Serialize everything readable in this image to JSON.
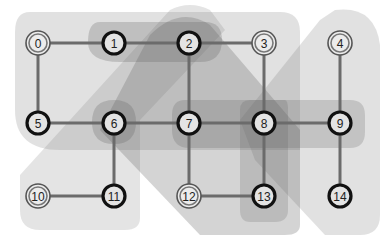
{
  "diagram": {
    "type": "graph-with-hyperedges",
    "nodes": [
      {
        "id": 0,
        "label": "0",
        "style": "double"
      },
      {
        "id": 1,
        "label": "1",
        "style": "bold"
      },
      {
        "id": 2,
        "label": "2",
        "style": "bold"
      },
      {
        "id": 3,
        "label": "3",
        "style": "double"
      },
      {
        "id": 4,
        "label": "4",
        "style": "double"
      },
      {
        "id": 5,
        "label": "5",
        "style": "bold"
      },
      {
        "id": 6,
        "label": "6",
        "style": "bold"
      },
      {
        "id": 7,
        "label": "7",
        "style": "bold"
      },
      {
        "id": 8,
        "label": "8",
        "style": "bold"
      },
      {
        "id": 9,
        "label": "9",
        "style": "bold"
      },
      {
        "id": 10,
        "label": "10",
        "style": "double"
      },
      {
        "id": 11,
        "label": "11",
        "style": "bold"
      },
      {
        "id": 12,
        "label": "12",
        "style": "double"
      },
      {
        "id": 13,
        "label": "13",
        "style": "bold"
      },
      {
        "id": 14,
        "label": "14",
        "style": "bold"
      }
    ],
    "edges": [
      [
        0,
        1
      ],
      [
        1,
        2
      ],
      [
        2,
        3
      ],
      [
        0,
        5
      ],
      [
        2,
        7
      ],
      [
        3,
        8
      ],
      [
        4,
        9
      ],
      [
        5,
        6
      ],
      [
        6,
        7
      ],
      [
        7,
        8
      ],
      [
        8,
        9
      ],
      [
        6,
        11
      ],
      [
        7,
        12
      ],
      [
        8,
        13
      ],
      [
        9,
        14
      ],
      [
        10,
        11
      ],
      [
        12,
        13
      ]
    ],
    "regions": [
      {
        "name": "region-top-left-rect",
        "nodes": [
          0,
          1,
          2,
          3,
          5,
          6,
          7,
          8
        ]
      },
      {
        "name": "region-diagonal-left",
        "nodes": [
          10,
          11,
          6,
          2,
          1
        ]
      },
      {
        "name": "region-right-big",
        "nodes": [
          4,
          9,
          14,
          13,
          12,
          7,
          8
        ]
      },
      {
        "name": "region-diagonal-center",
        "nodes": [
          2,
          6,
          7,
          12,
          13,
          14
        ]
      },
      {
        "name": "region-1-2",
        "nodes": [
          1,
          2
        ]
      },
      {
        "name": "region-6",
        "nodes": [
          6
        ]
      },
      {
        "name": "region-7-8-9",
        "nodes": [
          7,
          8,
          9
        ]
      },
      {
        "name": "region-8-13",
        "nodes": [
          8,
          13
        ]
      }
    ]
  }
}
